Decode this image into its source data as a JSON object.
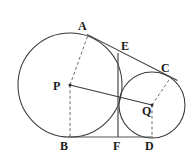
{
  "figure": {
    "canvas": {
      "width": 193,
      "height": 157
    },
    "colors": {
      "stroke": "#3a3a3a",
      "dashed_stroke": "#6b6b6b",
      "baseline": "#555555",
      "label": "#1b1b1b",
      "background": "#ffffff"
    },
    "circles": [
      {
        "name": "large-circle",
        "center_label": "P",
        "cx": 70,
        "cy": 85,
        "r": 52
      },
      {
        "name": "small-circle",
        "center_label": "Q",
        "cx": 152,
        "cy": 105,
        "r": 33
      }
    ],
    "points": {
      "A": {
        "x": 88,
        "y": 35,
        "label": "A",
        "label_x": 78,
        "label_y": 20
      },
      "E": {
        "x": 118,
        "y": 53,
        "label": "E",
        "label_x": 121,
        "label_y": 40
      },
      "C": {
        "x": 171,
        "y": 77,
        "label": "C",
        "label_x": 161,
        "label_y": 62
      },
      "P": {
        "x": 70,
        "y": 85,
        "label": "P",
        "label_x": 54,
        "label_y": 82
      },
      "Q": {
        "x": 152,
        "y": 105,
        "label": "Q",
        "label_x": 143,
        "label_y": 105
      },
      "B": {
        "x": 70,
        "y": 137,
        "label": "B",
        "label_x": 60,
        "label_y": 141
      },
      "F": {
        "x": 118,
        "y": 137,
        "label": "F",
        "label_x": 113,
        "label_y": 141
      },
      "D": {
        "x": 152,
        "y": 137,
        "label": "D",
        "label_x": 145,
        "label_y": 141
      }
    },
    "segments": [
      {
        "name": "tangent-line-AC",
        "from": "A",
        "to": "C",
        "style": "solid"
      },
      {
        "name": "segment-EF",
        "from": "E",
        "to": "F",
        "style": "solid"
      },
      {
        "name": "segment-PQ",
        "from": "P",
        "to": "Q",
        "style": "solid"
      },
      {
        "name": "baseline-BD",
        "from": "B",
        "to": "D",
        "style": "solid"
      },
      {
        "name": "radius-PA",
        "from": "P",
        "to": "A",
        "style": "dashed"
      },
      {
        "name": "radius-PB",
        "from": "P",
        "to": "B",
        "style": "dashed"
      },
      {
        "name": "radius-QC",
        "from": "Q",
        "to": "C",
        "style": "dashed"
      },
      {
        "name": "radius-QD",
        "from": "Q",
        "to": "D",
        "style": "dashed"
      }
    ],
    "labels": {
      "A": "A",
      "B": "B",
      "C": "C",
      "D": "D",
      "E": "E",
      "F": "F",
      "P": "P",
      "Q": "Q"
    }
  }
}
